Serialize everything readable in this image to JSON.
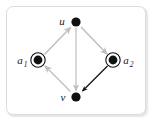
{
  "figure": {
    "frame": {
      "name": "graph-frame",
      "x": 6,
      "y": 6,
      "width": 140,
      "height": 109,
      "border_color": "#dcdcdc",
      "background": "#ffffff",
      "corner_radius": 7
    },
    "colors": {
      "node_fill": "#111111",
      "ring_stroke": "#111111",
      "edge_gray": "#bfbfbf",
      "edge_black": "#111111",
      "label_color": "#1a1a1a",
      "frame_border": "#dcdcdc",
      "background": "#ffffff"
    }
  },
  "graph_data": {
    "type": "diagram",
    "layout": "diamond",
    "directed": true,
    "nodes": [
      {
        "id": "u",
        "label": "u",
        "subscript": "",
        "x": 76,
        "y": 22,
        "radius": 4.6,
        "style": "filled-dot",
        "ringed": false,
        "label_position": "left",
        "label_x": 62,
        "label_y": 25
      },
      {
        "id": "a1",
        "label": "a",
        "subscript": "1",
        "x": 38,
        "y": 60,
        "radius": 4.4,
        "style": "filled-dot-with-ring",
        "ringed": true,
        "ring_radius": 7.2,
        "label_position": "left",
        "label_x": 18,
        "label_y": 64
      },
      {
        "id": "a2",
        "label": "a",
        "subscript": "2",
        "x": 113,
        "y": 60,
        "radius": 4.4,
        "style": "filled-dot-with-ring",
        "ringed": true,
        "ring_radius": 7.2,
        "label_position": "right",
        "label_x": 123,
        "label_y": 64
      },
      {
        "id": "v",
        "label": "v",
        "subscript": "",
        "x": 76,
        "y": 97,
        "radius": 4.6,
        "style": "filled-dot",
        "ringed": false,
        "label_position": "left",
        "label_x": 62,
        "label_y": 101
      }
    ],
    "edges": [
      {
        "id": "a1-to-u",
        "from": "a1",
        "to": "u",
        "color": "#bfbfbf",
        "emphasis": "normal",
        "arrowhead": "gray",
        "x1": 44.6,
        "y1": 54.2,
        "x2": 70.5,
        "y2": 27.5
      },
      {
        "id": "u-to-a2",
        "from": "u",
        "to": "a2",
        "color": "#bfbfbf",
        "emphasis": "normal",
        "arrowhead": "gray",
        "x1": 81.0,
        "y1": 27.0,
        "x2": 107.0,
        "y2": 54.0
      },
      {
        "id": "u-to-v",
        "from": "u",
        "to": "v",
        "color": "#bfbfbf",
        "emphasis": "normal",
        "arrowhead": "gray",
        "x1": 76,
        "y1": 28,
        "x2": 76,
        "y2": 90.5
      },
      {
        "id": "v-to-a1",
        "from": "v",
        "to": "a1",
        "color": "#bfbfbf",
        "emphasis": "normal",
        "arrowhead": "gray",
        "x1": 70.5,
        "y1": 91.5,
        "x2": 45.0,
        "y2": 66.0
      },
      {
        "id": "a2-to-v",
        "from": "a2",
        "to": "v",
        "color": "#111111",
        "emphasis": "highlighted",
        "arrowhead": "black",
        "x1": 107.5,
        "y1": 66.0,
        "x2": 82.5,
        "y2": 91.0
      }
    ]
  }
}
